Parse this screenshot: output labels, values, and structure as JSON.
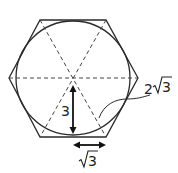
{
  "figure": {
    "labels": {
      "apothem": "3",
      "side_half_radical": "3",
      "side_full_coef": "2",
      "side_full_radical": "3"
    },
    "colors": {
      "stroke": "#2a2a2a",
      "dashed": "#444444",
      "text": "#222222"
    }
  }
}
